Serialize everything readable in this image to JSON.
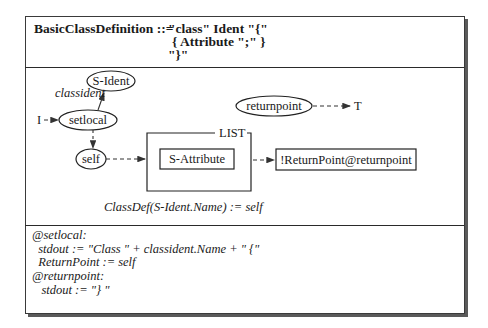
{
  "grammar": {
    "lhs": "BasicClassDefinition ::=",
    "rhs_lines": [
      "\"class\" Ident \"{\"",
      "{ Attribute \";\" }",
      "\"}\""
    ]
  },
  "diagram": {
    "nodes": {
      "s_ident": "S-Ident",
      "setlocal": "setlocal",
      "self": "self",
      "returnpoint": "returnpoint",
      "s_attribute": "S-Attribute",
      "return_target": "!ReturnPoint@returnpoint"
    },
    "edge_labels": {
      "classident": "classident",
      "input": "I",
      "terminal": "T"
    },
    "list_label": "LIST",
    "assignment": "ClassDef(S-Ident.Name) := self"
  },
  "actions": {
    "lines": [
      "@setlocal:",
      "  stdout := \"Class \" + classident.Name + \" {\"",
      "  ReturnPoint := self",
      "@returnpoint:",
      "   stdout := \"} \""
    ]
  }
}
